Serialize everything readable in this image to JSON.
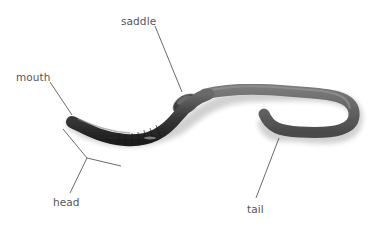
{
  "diagram": {
    "labels": [
      {
        "id": "mouth",
        "text": "mouth"
      },
      {
        "id": "saddle",
        "text": "saddle"
      },
      {
        "id": "head",
        "text": "head"
      },
      {
        "id": "tail",
        "text": "tail"
      }
    ],
    "colors": {
      "background": "#ffffff",
      "label_text": "#555555",
      "leader_line": "#444444",
      "worm_dark": "#2a2a2a",
      "worm_mid": "#5a5a5a",
      "worm_light": "#8a8a8a"
    }
  }
}
